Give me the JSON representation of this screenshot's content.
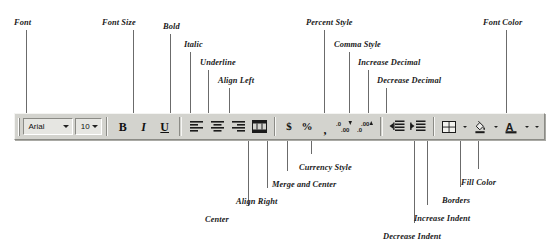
{
  "figure": {
    "kind": "annotated-toolbar-diagram"
  },
  "toolbar": {
    "font_name": {
      "value": "Arial",
      "icon": "chevron-down-icon"
    },
    "font_size": {
      "value": "10",
      "icon": "chevron-down-icon"
    },
    "buttons": [
      {
        "name": "bold",
        "glyph": "B"
      },
      {
        "name": "italic",
        "glyph": "I"
      },
      {
        "name": "underline",
        "glyph": "U"
      },
      {
        "name": "align-left",
        "glyph": "align-left-icon"
      },
      {
        "name": "center",
        "glyph": "align-center-icon"
      },
      {
        "name": "align-right",
        "glyph": "align-right-icon"
      },
      {
        "name": "merge-and-center",
        "glyph": "merge-center-icon"
      },
      {
        "name": "currency-style",
        "glyph": "$"
      },
      {
        "name": "percent-style",
        "glyph": "%"
      },
      {
        "name": "comma-style",
        "glyph": ","
      },
      {
        "name": "increase-decimal",
        "glyph": "increase-decimal-icon"
      },
      {
        "name": "decrease-decimal",
        "glyph": "decrease-decimal-icon"
      },
      {
        "name": "decrease-indent",
        "glyph": "decrease-indent-icon"
      },
      {
        "name": "increase-indent",
        "glyph": "increase-indent-icon"
      },
      {
        "name": "borders",
        "glyph": "borders-icon"
      },
      {
        "name": "fill-color",
        "glyph": "paint-bucket-icon"
      },
      {
        "name": "font-color",
        "glyph": "font-color-a-icon"
      }
    ]
  },
  "callouts_top": [
    {
      "label": "Font",
      "label_x": 14,
      "label_y": 18,
      "line_x": 26,
      "line_top": 30,
      "line_bottom": 113
    },
    {
      "label": "Font Size",
      "label_x": 102,
      "label_y": 18,
      "line_x": 133,
      "line_top": 30,
      "line_bottom": 113
    },
    {
      "label": "Bold",
      "label_x": 163,
      "label_y": 22,
      "line_x": 170,
      "line_top": 34,
      "line_bottom": 113
    },
    {
      "label": "Italic",
      "label_x": 184,
      "label_y": 40,
      "line_x": 190,
      "line_top": 52,
      "line_bottom": 113
    },
    {
      "label": "Underline",
      "label_x": 200,
      "label_y": 58,
      "line_x": 208,
      "line_top": 70,
      "line_bottom": 113
    },
    {
      "label": "Align Left",
      "label_x": 218,
      "label_y": 76,
      "line_x": 229,
      "line_top": 88,
      "line_bottom": 113
    },
    {
      "label": "Percent Style",
      "label_x": 306,
      "label_y": 18,
      "line_x": 324,
      "line_top": 30,
      "line_bottom": 113
    },
    {
      "label": "Comma Style",
      "label_x": 334,
      "label_y": 40,
      "line_x": 349,
      "line_top": 52,
      "line_bottom": 113
    },
    {
      "label": "Increase Decimal",
      "label_x": 358,
      "label_y": 58,
      "line_x": 368,
      "line_top": 70,
      "line_bottom": 113
    },
    {
      "label": "Decrease Decimal",
      "label_x": 377,
      "label_y": 76,
      "line_x": 386,
      "line_top": 88,
      "line_bottom": 113
    },
    {
      "label": "Font Color",
      "label_x": 483,
      "label_y": 18,
      "line_x": 506,
      "line_top": 30,
      "line_bottom": 113
    }
  ],
  "callouts_bottom": [
    {
      "label": "Center",
      "label_x": 205,
      "label_y": 215,
      "line_x": 248,
      "line_top": 141,
      "line_bottom": 206
    },
    {
      "label": "Align Right",
      "label_x": 236,
      "label_y": 197,
      "line_x": 267,
      "line_top": 141,
      "line_bottom": 188
    },
    {
      "label": "Merge and Center",
      "label_x": 272,
      "label_y": 180,
      "line_x": 287,
      "line_top": 141,
      "line_bottom": 171
    },
    {
      "label": "Currency Style",
      "label_x": 299,
      "label_y": 163,
      "line_x": 311,
      "line_top": 141,
      "line_bottom": 154
    },
    {
      "label": "Decrease Indent",
      "label_x": 383,
      "label_y": 232,
      "line_x": 414,
      "line_top": 141,
      "line_bottom": 223
    },
    {
      "label": "Increase Indent",
      "label_x": 414,
      "label_y": 214,
      "line_x": 427,
      "line_top": 141,
      "line_bottom": 205
    },
    {
      "label": "Borders",
      "label_x": 442,
      "label_y": 196,
      "line_x": 460,
      "line_top": 141,
      "line_bottom": 187
    },
    {
      "label": "Fill Color",
      "label_x": 461,
      "label_y": 178,
      "line_x": 478,
      "line_top": 141,
      "line_bottom": 169
    }
  ]
}
